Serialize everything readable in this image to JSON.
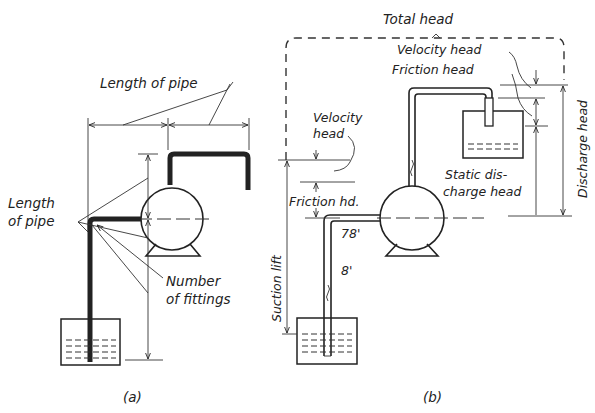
{
  "figure": {
    "panel_a": {
      "caption": "(a)",
      "labels": {
        "length_of_pipe_top": "Length of pipe",
        "length_of_pipe_left_line1": "Length",
        "length_of_pipe_left_line2": "of pipe",
        "number_of_fittings_line1": "Number",
        "number_of_fittings_line2": "of fittings"
      }
    },
    "panel_b": {
      "caption": "(b)",
      "labels": {
        "total_head": "Total head",
        "velocity_head_discharge": "Velocity head",
        "friction_head_discharge": "Friction head",
        "velocity_head_suction_line1": "Velocity",
        "velocity_head_suction_line2": "head",
        "friction_hd_suction": "Friction hd.",
        "static_discharge_head_line1": "Static dis-",
        "static_discharge_head_line2": "charge head",
        "discharge_head": "Discharge head",
        "suction_lift": "Suction lift",
        "length_horizontal": "78'",
        "length_vertical": "8'"
      }
    }
  }
}
